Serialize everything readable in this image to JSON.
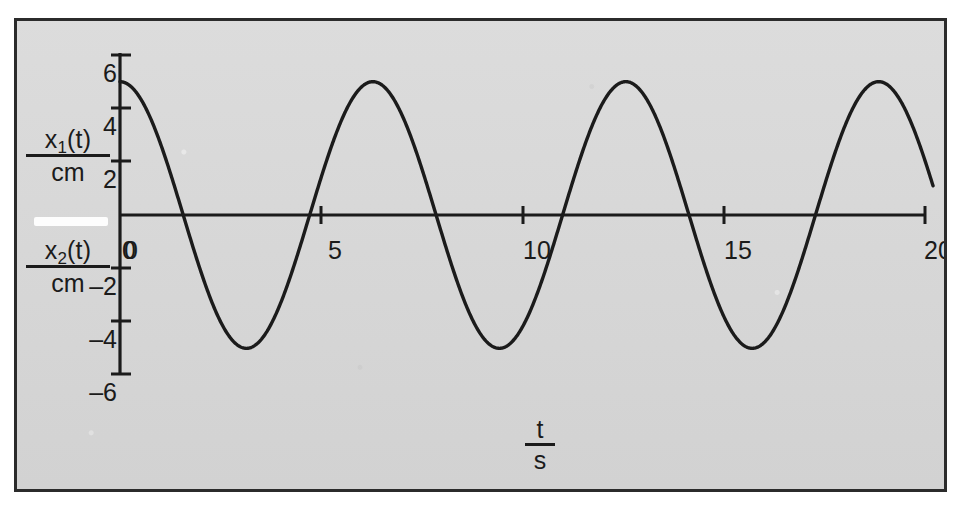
{
  "figure": {
    "background_color": "#d7d7d7",
    "frame_color": "#2b2b2b",
    "curve_color": "#1b1b1b"
  },
  "y_axis": {
    "caption_primary": {
      "numerator": "x",
      "subscript": "1",
      "variable": "(t)",
      "denominator": "cm"
    },
    "caption_secondary": {
      "numerator": "x",
      "subscript": "2",
      "variable": "(t)",
      "denominator": "cm"
    },
    "ticks": [
      "6",
      "4",
      "2",
      "0",
      "2",
      "4",
      "6"
    ],
    "tick_values": [
      6,
      4,
      2,
      0,
      -2,
      -4,
      -6
    ],
    "negative_sign": "–"
  },
  "x_axis": {
    "caption": {
      "numerator": "t",
      "denominator": "s"
    },
    "ticks": [
      "0",
      "5",
      "10",
      "15",
      "20"
    ],
    "tick_values": [
      0,
      5,
      10,
      15,
      20
    ]
  },
  "chart_data": {
    "type": "line",
    "title": "",
    "subtitle": "",
    "xlabel": "t / s",
    "ylabel": "x₁(t) / cm,  x₂(t) / cm",
    "xlim": [
      0,
      20
    ],
    "ylim": [
      -6,
      6
    ],
    "xticks": [
      0,
      5,
      10,
      15,
      20
    ],
    "yticks": [
      -6,
      -4,
      -2,
      0,
      2,
      4,
      6
    ],
    "grid": false,
    "legend": false,
    "legend_position": "none",
    "annotations": [],
    "series": [
      {
        "name": "x(t) = 5 cm · cos(t / s)",
        "amplitude": 5,
        "period": 6.2832,
        "phase_deg": 0,
        "offset": 0,
        "color": "#1b1b1b",
        "x_start": 0,
        "x_end": 20.2,
        "key_points": [
          {
            "t": 0.0,
            "x": 5.0,
            "kind": "start-maximum"
          },
          {
            "t": 1.57,
            "x": 0.0,
            "kind": "zero-crossing-falling"
          },
          {
            "t": 3.14,
            "x": -5.0,
            "kind": "minimum"
          },
          {
            "t": 4.71,
            "x": 0.0,
            "kind": "zero-crossing-rising"
          },
          {
            "t": 6.28,
            "x": 5.0,
            "kind": "maximum"
          },
          {
            "t": 7.85,
            "x": 0.0,
            "kind": "zero-crossing-falling"
          },
          {
            "t": 9.42,
            "x": -5.0,
            "kind": "minimum"
          },
          {
            "t": 11.0,
            "x": 0.0,
            "kind": "zero-crossing-rising"
          },
          {
            "t": 12.57,
            "x": 5.0,
            "kind": "maximum"
          },
          {
            "t": 14.14,
            "x": 0.0,
            "kind": "zero-crossing-falling"
          },
          {
            "t": 15.71,
            "x": -5.0,
            "kind": "minimum"
          },
          {
            "t": 17.28,
            "x": 0.0,
            "kind": "zero-crossing-rising"
          },
          {
            "t": 18.85,
            "x": 5.0,
            "kind": "maximum"
          },
          {
            "t": 20.2,
            "x": 1.9,
            "kind": "end"
          }
        ]
      }
    ]
  }
}
